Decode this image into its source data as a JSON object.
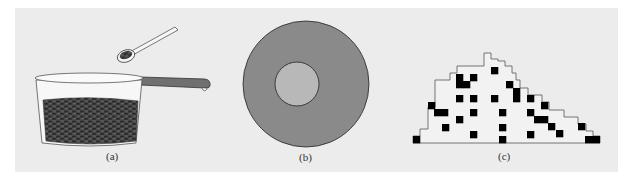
{
  "figure": {
    "background_color": "#ececec",
    "panels": [
      {
        "id": "a",
        "caption": "(a)",
        "description": "glass pot filled with beans, spoon with beans above",
        "colors": {
          "beans": "#3a3a3a",
          "handle": "#6e6e6e",
          "glass": "#f4f4f4"
        }
      },
      {
        "id": "b",
        "caption": "(b)",
        "description": "annulus: dark gray ring with light gray inner disk",
        "colors": {
          "outer": "#8a8a8a",
          "inner": "#b8b8b8",
          "stroke": "#222222"
        }
      },
      {
        "id": "c",
        "caption": "(c)",
        "description": "staircase outline with scattered black squares",
        "colors": {
          "squares": "#000000",
          "outline": "#555555",
          "fill": "#f2f2f2"
        }
      }
    ]
  }
}
